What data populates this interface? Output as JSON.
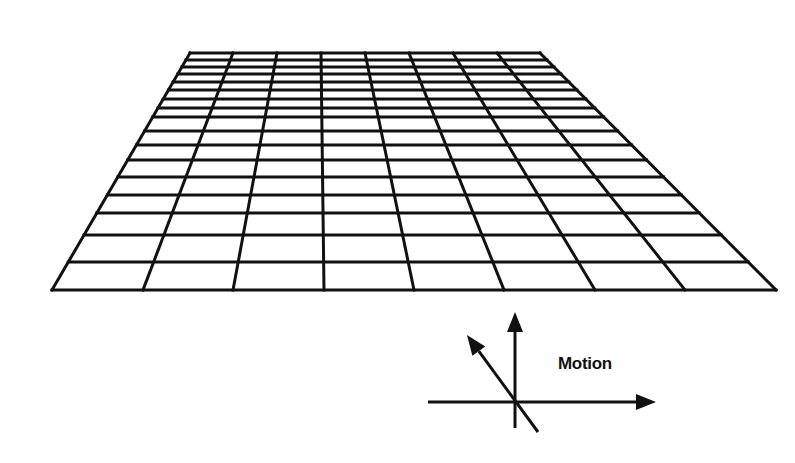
{
  "figure": {
    "colors": {
      "line": "#111111",
      "background": "#ffffff"
    }
  },
  "grid": {
    "corners": {
      "top_left": [
        190,
        53
      ],
      "top_right": [
        540,
        53
      ],
      "bottom_left": [
        52,
        290
      ],
      "bottom_right": [
        776,
        290
      ]
    },
    "columns": 8,
    "top_x": [
      190,
      233,
      277,
      321,
      365,
      409,
      453,
      497,
      540
    ],
    "bottom_x": [
      52,
      143,
      233,
      324,
      414,
      504,
      595,
      685,
      776
    ],
    "row_y": [
      53,
      60,
      67,
      74,
      82,
      90,
      99,
      108,
      117,
      131,
      145,
      160,
      177,
      195,
      213,
      235,
      262,
      290
    ]
  },
  "axes": {
    "origin": [
      515,
      402
    ],
    "vertical": {
      "from": [
        515,
        428
      ],
      "to": [
        515,
        312
      ]
    },
    "horizontal": {
      "from": [
        428,
        402
      ],
      "to": [
        656,
        402
      ]
    },
    "diagonal": {
      "from": [
        538,
        432
      ],
      "to": [
        467,
        335
      ]
    }
  },
  "label": {
    "text": "Motion",
    "x": 558,
    "y": 354
  }
}
